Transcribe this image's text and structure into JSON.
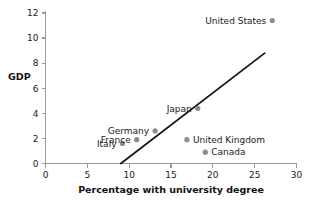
{
  "chart_data": {
    "type": "scatter",
    "title": "",
    "xlabel": "Percentage with university degree",
    "ylabel": "GDP",
    "xlim": [
      0,
      30
    ],
    "ylim": [
      0,
      12
    ],
    "xticks": [
      0,
      5,
      10,
      15,
      20,
      25,
      30
    ],
    "yticks": [
      0,
      2,
      4,
      6,
      8,
      10,
      12
    ],
    "grid": false,
    "legend": "none",
    "marker_color": "#8c8c8c",
    "line_color": "#141414",
    "axis_color": "#9a9a9a",
    "points": [
      {
        "label": "Italy",
        "x": 9.2,
        "y": 1.6,
        "label_side": "left"
      },
      {
        "label": "France",
        "x": 10.9,
        "y": 1.9,
        "label_side": "left"
      },
      {
        "label": "Germany",
        "x": 13.1,
        "y": 2.6,
        "label_side": "left"
      },
      {
        "label": "United Kingdom",
        "x": 16.9,
        "y": 1.9,
        "label_side": "right"
      },
      {
        "label": "Japan",
        "x": 18.2,
        "y": 4.4,
        "label_side": "left"
      },
      {
        "label": "Canada",
        "x": 19.1,
        "y": 0.9,
        "label_side": "right"
      },
      {
        "label": "United States",
        "x": 27.1,
        "y": 11.4,
        "label_side": "left"
      }
    ],
    "trend_line": {
      "x_start": 9.0,
      "y_start": 0.0,
      "x_end": 26.2,
      "y_end": 8.8
    }
  },
  "labels": {
    "italy": "Italy",
    "france": "France",
    "germany": "Germany",
    "united_kingdom": "United Kingdom",
    "japan": "Japan",
    "canada": "Canada",
    "united_states": "United States",
    "y_axis_title": "GDP",
    "x_axis_title": "Percentage with university degree",
    "xtick_0": "0",
    "xtick_5": "5",
    "xtick_10": "10",
    "xtick_15": "15",
    "xtick_20": "20",
    "xtick_25": "25",
    "xtick_30": "30",
    "ytick_0": "0",
    "ytick_2": "2",
    "ytick_4": "4",
    "ytick_6": "6",
    "ytick_8": "8",
    "ytick_10": "10",
    "ytick_12": "12"
  }
}
